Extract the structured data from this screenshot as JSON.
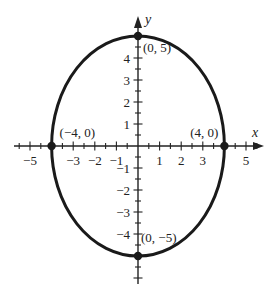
{
  "chart_data": {
    "type": "line",
    "title": "",
    "xlabel": "x",
    "ylabel": "y",
    "xlim": [
      -5.5,
      5.5
    ],
    "ylim": [
      -5.5,
      5.5
    ],
    "grid": false,
    "x_tick_labels": [
      "-5",
      "-3",
      "-2",
      "-1",
      "1",
      "2",
      "3",
      "5"
    ],
    "x_tick_values": [
      -5,
      -3,
      -2,
      -1,
      1,
      2,
      3,
      5
    ],
    "y_tick_labels": [
      "4",
      "3",
      "2",
      "1",
      "-1",
      "-2",
      "-3",
      "-4"
    ],
    "y_tick_values": [
      4,
      3,
      2,
      1,
      -1,
      -2,
      -3,
      -4
    ],
    "minor_tick_step": 0.5,
    "series": [
      {
        "name": "ellipse",
        "center": [
          0,
          0
        ],
        "semi_axis_x": 4,
        "semi_axis_y": 5
      }
    ],
    "points": [
      {
        "x": 0,
        "y": 5,
        "label": "(0, 5)"
      },
      {
        "x": -4,
        "y": 0,
        "label": "(−4, 0)"
      },
      {
        "x": 4,
        "y": 0,
        "label": "(4, 0)"
      },
      {
        "x": 0,
        "y": -5,
        "label": "(0, −5)"
      }
    ]
  },
  "colors": {
    "curve": "#1a1a1a",
    "axis": "#222222"
  }
}
